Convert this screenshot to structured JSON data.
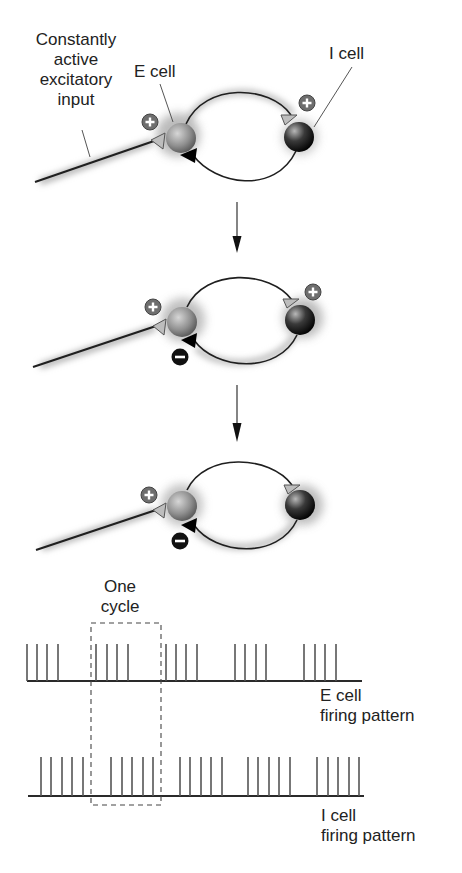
{
  "labels": {
    "input": [
      "Constantly",
      "active",
      "excitatory",
      "input"
    ],
    "e_cell": "E cell",
    "i_cell": "I cell",
    "one_cycle": [
      "One",
      "cycle"
    ],
    "e_pattern": [
      "E cell",
      "firing pattern"
    ],
    "i_pattern": [
      "I cell",
      "firing pattern"
    ]
  },
  "signs": {
    "plus": "+",
    "minus": "−"
  },
  "panels": [
    {
      "step": 1,
      "e_input_sign": "+",
      "i_input_sign": "+",
      "e_inhibition_sign": ""
    },
    {
      "step": 2,
      "e_input_sign": "+",
      "i_input_sign": "+",
      "e_inhibition_sign": "−"
    },
    {
      "step": 3,
      "e_input_sign": "+",
      "i_input_sign": "",
      "e_inhibition_sign": "−"
    }
  ],
  "colors": {
    "e_cell": "#8a8a8a",
    "i_cell": "#1a1a1a",
    "line": "#1f1f1f",
    "spike": "#555555",
    "glow": "#9a9a9a",
    "plus_badge": "#6e6e6e",
    "minus_badge": "#111111"
  },
  "firing": {
    "e_cell_spike_x": [
      27,
      37,
      47,
      58,
      96,
      107,
      117,
      128,
      166,
      176,
      186,
      197,
      235,
      245,
      256,
      266,
      304,
      315,
      325,
      336
    ],
    "i_cell_spike_x": [
      41,
      51,
      62,
      72,
      83,
      111,
      122,
      132,
      143,
      153,
      180,
      190,
      201,
      211,
      222,
      248,
      258,
      269,
      279,
      290,
      317,
      328,
      338,
      349,
      359
    ],
    "e_bursts": 5,
    "e_spikes_per_burst": 4,
    "i_bursts": 5,
    "i_spikes_per_burst": 5
  }
}
